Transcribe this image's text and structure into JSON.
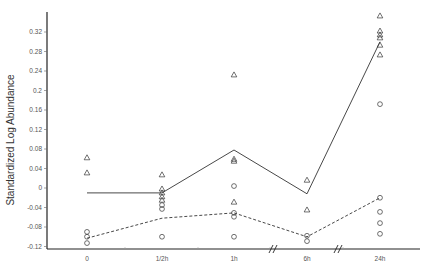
{
  "chart_data": {
    "type": "line",
    "title": "",
    "xlabel": "",
    "ylabel": "Standardized Log  Abundance",
    "categories": [
      "0",
      "1/2h",
      "1h",
      "6h",
      "24h"
    ],
    "ylim": [
      -0.125,
      0.36
    ],
    "yticks": [
      0.32,
      0.28,
      0.24,
      0.2,
      0.16,
      0.12,
      0.08,
      0.04,
      0,
      -0.04,
      -0.08,
      -0.12
    ],
    "ytick_labels": [
      "0.32",
      "0.28",
      "0.24",
      "0.2",
      "0.16",
      "0.12",
      "0.08",
      "0.04",
      "0",
      "-0.04",
      "-0.08",
      "-0.12"
    ],
    "grid": false,
    "legend": null,
    "axis_breaks_between": [
      [
        "1h",
        "6h"
      ],
      [
        "6h",
        "24h"
      ]
    ],
    "series": [
      {
        "name": "triangle-mean",
        "style": "solid",
        "marker": "none",
        "values": [
          -0.01,
          -0.01,
          0.078,
          -0.012,
          0.3
        ]
      },
      {
        "name": "circle-mean",
        "style": "dashed",
        "marker": "none",
        "values": [
          -0.103,
          -0.062,
          -0.051,
          -0.1,
          -0.02
        ]
      },
      {
        "name": "triangle-points",
        "style": "scatter",
        "marker": "triangle",
        "points": [
          {
            "x": "0",
            "values": [
              0.062,
              0.031
            ]
          },
          {
            "x": "1/2h",
            "values": [
              0.027,
              -0.002,
              -0.01,
              -0.018,
              -0.025
            ]
          },
          {
            "x": "1h",
            "values": [
              0.232,
              0.059,
              0.055,
              -0.029
            ]
          },
          {
            "x": "6h",
            "values": [
              0.016,
              -0.045
            ]
          },
          {
            "x": "24h",
            "values": [
              0.353,
              0.322,
              0.314,
              0.308,
              0.293,
              0.273
            ]
          }
        ]
      },
      {
        "name": "circle-points",
        "style": "scatter",
        "marker": "circle",
        "points": [
          {
            "x": "0",
            "values": [
              -0.09,
              -0.1,
              -0.113
            ]
          },
          {
            "x": "1/2h",
            "values": [
              -0.035,
              -0.043,
              -0.1
            ]
          },
          {
            "x": "1h",
            "values": [
              0.004,
              -0.051,
              -0.059,
              -0.1
            ]
          },
          {
            "x": "6h",
            "values": [
              -0.098,
              -0.109
            ]
          },
          {
            "x": "24h",
            "values": [
              0.172,
              -0.02,
              -0.049,
              -0.072,
              -0.094
            ]
          }
        ]
      }
    ]
  }
}
